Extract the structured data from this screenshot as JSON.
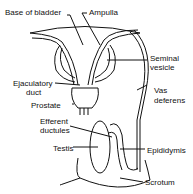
{
  "diagram": {
    "labels": {
      "base_of_bladder": "Base of bladder",
      "ampulla": "Ampulla",
      "seminal_vesicle_1": "Seminal",
      "seminal_vesicle_2": "vesicle",
      "ejaculatory_duct_1": "Ejaculatory",
      "ejaculatory_duct_2": "duct",
      "vas_deferens_1": "Vas",
      "vas_deferens_2": "deferens",
      "prostate": "Prostate",
      "efferent_ductules_1": "Efferent",
      "efferent_ductules_2": "ductules",
      "testis": "Testis",
      "epididymis": "Epididymis",
      "scrotum": "Scrotum"
    },
    "stroke_color": "#111111"
  }
}
